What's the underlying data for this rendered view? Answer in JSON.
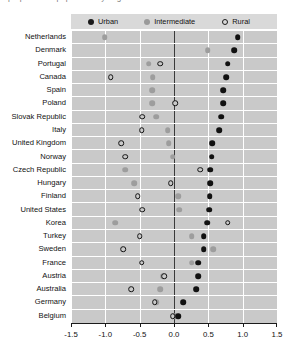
{
  "caption": {
    "text": "proportion of population by degree of urbanisation"
  },
  "legend": {
    "position": "top",
    "items": [
      {
        "label": "Urban",
        "key": "urban",
        "color": "#111111",
        "marker": "filled-circle"
      },
      {
        "label": "Intermediate",
        "key": "intermediate",
        "color": "#9d9d9d",
        "marker": "grey-circle"
      },
      {
        "label": "Rural",
        "key": "rural",
        "color": "#111111",
        "marker": "open-circle"
      }
    ]
  },
  "chart_data": {
    "type": "scatter",
    "title": "",
    "subtitle": "",
    "xlabel": "",
    "ylabel": "",
    "xlim": [
      -1.5,
      1.5
    ],
    "xticks": [
      -1.5,
      -1.0,
      -0.5,
      0.0,
      0.5,
      1.0,
      1.5
    ],
    "xticklabels": [
      "-1.5",
      "-1.0",
      "-0.5",
      "0.0",
      "0.5",
      "1.0",
      "1.5"
    ],
    "grid": true,
    "zero_line": 0.0,
    "orientation": "horizontal-dotplot",
    "categories": [
      "Netherlands",
      "Denmark",
      "Portugal",
      "Canada",
      "Spain",
      "Poland",
      "Slovak Republic",
      "Italy",
      "United Kingdom",
      "Norway",
      "Czech Republic",
      "Hungary",
      "Finland",
      "United States",
      "Korea",
      "Turkey",
      "Sweden",
      "France",
      "Austria",
      "Australia",
      "Germany",
      "Belgium"
    ],
    "series": [
      {
        "name": "Urban",
        "key": "urban",
        "color": "#111111",
        "values": [
          0.93,
          0.88,
          0.78,
          0.76,
          0.72,
          0.72,
          0.69,
          0.66,
          0.56,
          0.55,
          0.53,
          0.53,
          0.52,
          0.51,
          0.48,
          0.43,
          0.43,
          0.35,
          0.35,
          0.32,
          0.13,
          0.06
        ]
      },
      {
        "name": "Intermediate",
        "key": "intermediate",
        "color": "#9d9d9d",
        "values": [
          -1.01,
          0.49,
          -0.37,
          -0.31,
          -0.32,
          -0.32,
          -0.26,
          -0.09,
          -0.08,
          -0.02,
          -0.71,
          -0.58,
          0.06,
          0.08,
          -0.86,
          0.26,
          0.57,
          0.26,
          -0.16,
          -0.2,
          -0.26,
          0.02
        ]
      },
      {
        "name": "Rural",
        "key": "rural",
        "color": "#111111",
        "values": [
          null,
          null,
          -0.2,
          -0.92,
          null,
          0.02,
          -0.46,
          -0.47,
          -0.77,
          -0.71,
          0.38,
          -0.05,
          -0.53,
          -0.46,
          0.78,
          -0.5,
          -0.74,
          -0.47,
          -0.14,
          -0.62,
          -0.28,
          -0.02
        ]
      }
    ]
  }
}
